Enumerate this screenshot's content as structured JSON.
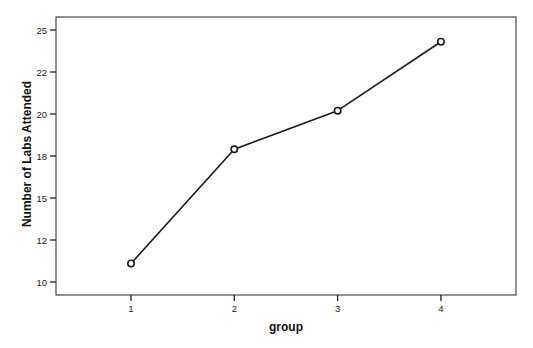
{
  "chart_data": {
    "type": "line",
    "title": "",
    "xlabel": "group",
    "ylabel": "Number of Labs Attended",
    "categories": [
      "1",
      "2",
      "3",
      "4"
    ],
    "x": [
      1,
      2,
      3,
      4
    ],
    "values": [
      11.1,
      17.9,
      20.2,
      24.3
    ],
    "series": [
      {
        "name": "Mean Number of Labs Attended",
        "values": [
          11.1,
          17.9,
          20.2,
          24.3
        ],
        "marker": "circle",
        "color": "#1a1a1a"
      }
    ],
    "y_ticks": [
      10,
      12.5,
      15,
      17.5,
      20,
      22.5,
      25
    ],
    "y_tick_labels": [
      "10",
      "12",
      "15",
      "18",
      "20",
      "22",
      "25"
    ],
    "x_ticks": [
      1,
      2,
      3,
      4
    ],
    "x_tick_labels": [
      "1",
      "2",
      "3",
      "4"
    ],
    "ylim": [
      9.2,
      25.8
    ],
    "xlim": [
      0.27,
      4.73
    ],
    "grid": false,
    "legend": null
  },
  "colors": {
    "frame": "#4a4a4a",
    "line": "#1a1a1a",
    "background": "#ffffff"
  }
}
